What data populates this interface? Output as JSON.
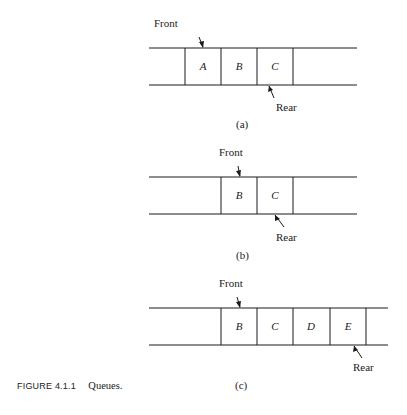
{
  "caption": {
    "figure_number": "FIGURE 4.1.1",
    "title": "Queues."
  },
  "panels": [
    {
      "id": "a",
      "sublabel": "(a)",
      "front_label": "Front",
      "rear_label": "Rear",
      "cells": [
        "A",
        "B",
        "C"
      ],
      "front_points_to": "A",
      "rear_points_to": "C"
    },
    {
      "id": "b",
      "sublabel": "(b)",
      "front_label": "Front",
      "rear_label": "Rear",
      "cells": [
        "B",
        "C"
      ],
      "front_points_to": "B",
      "rear_points_to": "C"
    },
    {
      "id": "c",
      "sublabel": "(c)",
      "front_label": "Front",
      "rear_label": "Rear",
      "cells": [
        "B",
        "C",
        "D",
        "E"
      ],
      "front_points_to": "B",
      "rear_points_to": "E"
    }
  ],
  "style": {
    "line_color": "#1a1a1a",
    "background": "#ffffff"
  }
}
